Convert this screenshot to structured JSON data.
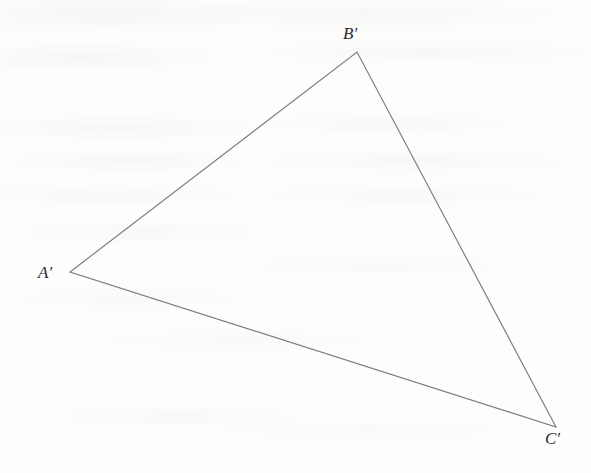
{
  "figure": {
    "kind": "geometry-diagram",
    "background_color": "#fdfdfc",
    "stroke_color": "#7a7a80",
    "stroke_width": 1.15,
    "label_color": "#2a2a2c",
    "width": 591,
    "height": 473,
    "vertices": [
      {
        "id": "A-prime",
        "label": "A′",
        "x": 70,
        "y": 272,
        "label_x": 38,
        "label_y": 264
      },
      {
        "id": "B-prime",
        "label": "B′",
        "x": 357,
        "y": 52,
        "label_x": 343,
        "label_y": 25
      },
      {
        "id": "C-prime",
        "label": "C′",
        "x": 556,
        "y": 427,
        "label_x": 545,
        "label_y": 430
      }
    ],
    "edges": [
      {
        "id": "edge-A-prime-B-prime",
        "from": "A-prime",
        "to": "B-prime"
      },
      {
        "id": "edge-B-prime-C-prime",
        "from": "B-prime",
        "to": "C-prime"
      },
      {
        "id": "edge-C-prime-A-prime",
        "from": "C-prime",
        "to": "A-prime"
      }
    ],
    "polygon_points": "70,272 357,52 556,427"
  }
}
